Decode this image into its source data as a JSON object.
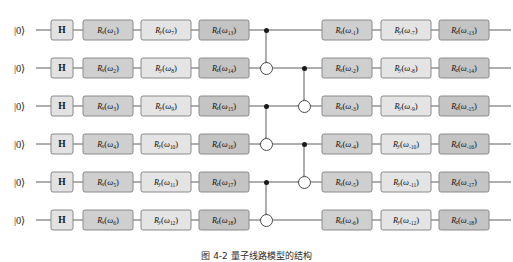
{
  "figure": {
    "caption": "图 4-2   量子线路模型的结构",
    "caption_top_px": 249
  },
  "colors": {
    "wire": "#4d4d4d",
    "gate_border": "#8a8a8a",
    "h_fill": "#e2e2e2",
    "rx_fill": "#cfcfcf",
    "ry_fill": "#e4e4e4",
    "rz_fill": "#c4c4c4",
    "control_dot": "#1a1a1a",
    "background": "#ffffff"
  },
  "layout": {
    "wire_y": [
      30,
      68,
      106,
      144,
      182,
      220
    ],
    "wire_x_start": 36,
    "wire_x_end": 511,
    "ket_x": 14,
    "h_x": 62,
    "h_w": 23,
    "h_h": 21,
    "col_x": [
      108,
      166,
      224,
      347,
      406,
      464
    ],
    "gate_w": 51,
    "gate_h": 21,
    "cnot_col_x": [
      266,
      304
    ]
  },
  "qubits": [
    {
      "index": 1,
      "init_label": "|0⟩"
    },
    {
      "index": 2,
      "init_label": "|0⟩"
    },
    {
      "index": 3,
      "init_label": "|0⟩"
    },
    {
      "index": 4,
      "init_label": "|0⟩"
    },
    {
      "index": 5,
      "init_label": "|0⟩"
    },
    {
      "index": 6,
      "init_label": "|0⟩"
    }
  ],
  "hadamards": [
    {
      "wire": 1,
      "label": "H"
    },
    {
      "wire": 2,
      "label": "H"
    },
    {
      "wire": 3,
      "label": "H"
    },
    {
      "wire": 4,
      "label": "H"
    },
    {
      "wire": 5,
      "label": "H"
    },
    {
      "wire": 6,
      "label": "H"
    }
  ],
  "gate_columns": [
    {
      "id": "rx-left",
      "type": "rx",
      "axis": "x",
      "gates": [
        {
          "wire": 1,
          "symbol": "R",
          "axis": "x",
          "param": "ω",
          "subscript": "1"
        },
        {
          "wire": 2,
          "symbol": "R",
          "axis": "x",
          "param": "ω",
          "subscript": "2"
        },
        {
          "wire": 3,
          "symbol": "R",
          "axis": "x",
          "param": "ω",
          "subscript": "3"
        },
        {
          "wire": 4,
          "symbol": "R",
          "axis": "x",
          "param": "ω",
          "subscript": "4"
        },
        {
          "wire": 5,
          "symbol": "R",
          "axis": "x",
          "param": "ω",
          "subscript": "5"
        },
        {
          "wire": 6,
          "symbol": "R",
          "axis": "x",
          "param": "ω",
          "subscript": "6"
        }
      ]
    },
    {
      "id": "ry-left",
      "type": "ry",
      "axis": "y",
      "gates": [
        {
          "wire": 1,
          "symbol": "R",
          "axis": "y",
          "param": "ω",
          "subscript": "7"
        },
        {
          "wire": 2,
          "symbol": "R",
          "axis": "y",
          "param": "ω",
          "subscript": "8"
        },
        {
          "wire": 3,
          "symbol": "R",
          "axis": "y",
          "param": "ω",
          "subscript": "9"
        },
        {
          "wire": 4,
          "symbol": "R",
          "axis": "y",
          "param": "ω",
          "subscript": "10"
        },
        {
          "wire": 5,
          "symbol": "R",
          "axis": "y",
          "param": "ω",
          "subscript": "11"
        },
        {
          "wire": 6,
          "symbol": "R",
          "axis": "y",
          "param": "ω",
          "subscript": "12"
        }
      ]
    },
    {
      "id": "rz-left",
      "type": "rz",
      "axis": "z",
      "gates": [
        {
          "wire": 1,
          "symbol": "R",
          "axis": "z",
          "param": "ω",
          "subscript": "13"
        },
        {
          "wire": 2,
          "symbol": "R",
          "axis": "z",
          "param": "ω",
          "subscript": "14"
        },
        {
          "wire": 3,
          "symbol": "R",
          "axis": "z",
          "param": "ω",
          "subscript": "15"
        },
        {
          "wire": 4,
          "symbol": "R",
          "axis": "z",
          "param": "ω",
          "subscript": "16"
        },
        {
          "wire": 5,
          "symbol": "R",
          "axis": "z",
          "param": "ω",
          "subscript": "17"
        },
        {
          "wire": 6,
          "symbol": "R",
          "axis": "z",
          "param": "ω",
          "subscript": "18"
        }
      ]
    },
    {
      "id": "rx-right",
      "type": "rx",
      "axis": "x",
      "gates": [
        {
          "wire": 1,
          "symbol": "R",
          "axis": "x",
          "param": "ω",
          "subscript": "-1"
        },
        {
          "wire": 2,
          "symbol": "R",
          "axis": "x",
          "param": "ω",
          "subscript": "-2"
        },
        {
          "wire": 3,
          "symbol": "R",
          "axis": "x",
          "param": "ω",
          "subscript": "-3"
        },
        {
          "wire": 4,
          "symbol": "R",
          "axis": "x",
          "param": "ω",
          "subscript": "-4"
        },
        {
          "wire": 5,
          "symbol": "R",
          "axis": "x",
          "param": "ω",
          "subscript": "-5"
        },
        {
          "wire": 6,
          "symbol": "R",
          "axis": "x",
          "param": "ω",
          "subscript": "-6"
        }
      ]
    },
    {
      "id": "ry-right",
      "type": "ry",
      "axis": "y",
      "gates": [
        {
          "wire": 1,
          "symbol": "R",
          "axis": "y",
          "param": "ω",
          "subscript": "-7"
        },
        {
          "wire": 2,
          "symbol": "R",
          "axis": "y",
          "param": "ω",
          "subscript": "-8"
        },
        {
          "wire": 3,
          "symbol": "R",
          "axis": "y",
          "param": "ω",
          "subscript": "-9"
        },
        {
          "wire": 4,
          "symbol": "R",
          "axis": "y",
          "param": "ω",
          "subscript": "-10"
        },
        {
          "wire": 5,
          "symbol": "R",
          "axis": "y",
          "param": "ω",
          "subscript": "-11"
        },
        {
          "wire": 6,
          "symbol": "R",
          "axis": "y",
          "param": "ω",
          "subscript": "-12"
        }
      ]
    },
    {
      "id": "rz-right",
      "type": "rz",
      "axis": "z",
      "gates": [
        {
          "wire": 1,
          "symbol": "R",
          "axis": "z",
          "param": "ω",
          "subscript": "-13"
        },
        {
          "wire": 2,
          "symbol": "R",
          "axis": "z",
          "param": "ω",
          "subscript": "-14"
        },
        {
          "wire": 3,
          "symbol": "R",
          "axis": "z",
          "param": "ω",
          "subscript": "-15"
        },
        {
          "wire": 4,
          "symbol": "R",
          "axis": "z",
          "param": "ω",
          "subscript": "-16"
        },
        {
          "wire": 5,
          "symbol": "R",
          "axis": "z",
          "param": "ω",
          "subscript": "-17"
        },
        {
          "wire": 6,
          "symbol": "R",
          "axis": "z",
          "param": "ω",
          "subscript": "-18"
        }
      ]
    }
  ],
  "cnots": [
    {
      "column": 0,
      "control_wire": 1,
      "target_wire": 2
    },
    {
      "column": 0,
      "control_wire": 3,
      "target_wire": 4
    },
    {
      "column": 0,
      "control_wire": 5,
      "target_wire": 6
    },
    {
      "column": 1,
      "control_wire": 2,
      "target_wire": 3
    },
    {
      "column": 1,
      "control_wire": 4,
      "target_wire": 5
    }
  ]
}
